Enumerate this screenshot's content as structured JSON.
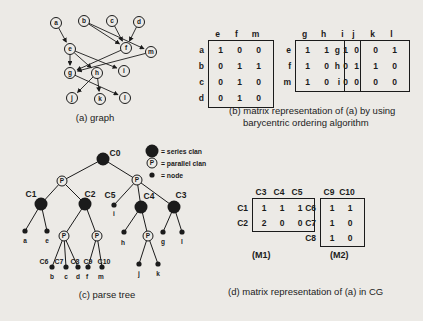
{
  "figure": {
    "background": "#eceae6",
    "ink": "#1b1b1b"
  },
  "graph_panel": {
    "caption": "(a) graph",
    "nodes": [
      {
        "id": "a",
        "x": 56,
        "y": 23
      },
      {
        "id": "b",
        "x": 84,
        "y": 21
      },
      {
        "id": "c",
        "x": 112,
        "y": 21
      },
      {
        "id": "d",
        "x": 139,
        "y": 22
      },
      {
        "id": "e",
        "x": 70,
        "y": 49
      },
      {
        "id": "f",
        "x": 126,
        "y": 48
      },
      {
        "id": "m",
        "x": 151,
        "y": 52
      },
      {
        "id": "g",
        "x": 70,
        "y": 73
      },
      {
        "id": "h",
        "x": 97,
        "y": 73
      },
      {
        "id": "i",
        "x": 124,
        "y": 71
      },
      {
        "id": "j",
        "x": 72,
        "y": 98
      },
      {
        "id": "k",
        "x": 100,
        "y": 99
      },
      {
        "id": "l",
        "x": 125,
        "y": 98
      }
    ],
    "edges": [
      {
        "from": "a",
        "to": "e"
      },
      {
        "from": "b",
        "to": "f"
      },
      {
        "from": "b",
        "to": "m"
      },
      {
        "from": "c",
        "to": "f"
      },
      {
        "from": "d",
        "to": "f"
      },
      {
        "from": "e",
        "to": "g"
      },
      {
        "from": "e",
        "to": "h"
      },
      {
        "from": "e",
        "to": "i"
      },
      {
        "from": "f",
        "to": "g"
      },
      {
        "from": "m",
        "to": "g"
      },
      {
        "from": "g",
        "to": "l"
      },
      {
        "from": "h",
        "to": "j"
      },
      {
        "from": "h",
        "to": "k"
      }
    ]
  },
  "matrix_panel_b": {
    "caption_line1": "(b) matrix representation of (a) by using",
    "caption_line2": "barycentric ordering algorithm",
    "matrices": [
      {
        "col_headers": [
          "e",
          "f",
          "m"
        ],
        "row_labels": [
          "a",
          "b",
          "c",
          "d"
        ],
        "values": [
          [
            1,
            0,
            0
          ],
          [
            0,
            1,
            1
          ],
          [
            0,
            1,
            0
          ],
          [
            0,
            1,
            0
          ]
        ]
      },
      {
        "col_headers": [
          "g",
          "h",
          "i"
        ],
        "row_labels": [
          "e",
          "f",
          "m"
        ],
        "values": [
          [
            1,
            1,
            1
          ],
          [
            1,
            0,
            0
          ],
          [
            1,
            0,
            0
          ]
        ]
      },
      {
        "col_headers": [
          "j",
          "k",
          "l"
        ],
        "row_labels": [
          "g",
          "h",
          "i"
        ],
        "values": [
          [
            0,
            0,
            1
          ],
          [
            1,
            1,
            0
          ],
          [
            0,
            0,
            0
          ]
        ]
      }
    ]
  },
  "tree_panel": {
    "caption": "(c) parse tree",
    "legend": [
      {
        "type": "series",
        "label": "= series clan"
      },
      {
        "type": "parallel",
        "label": "= parallel clan"
      },
      {
        "type": "leaf",
        "label": "= node"
      }
    ],
    "nodes": [
      {
        "id": "C0",
        "type": "series",
        "x": 103,
        "y": 159,
        "label": "C0",
        "lx": 115,
        "ly": 156
      },
      {
        "id": "PL",
        "type": "parallel",
        "x": 62,
        "y": 181
      },
      {
        "id": "PR",
        "type": "parallel",
        "x": 137,
        "y": 180
      },
      {
        "id": "C1",
        "type": "series",
        "x": 41,
        "y": 204,
        "label": "C1",
        "lx": 31,
        "ly": 197
      },
      {
        "id": "C2",
        "type": "series",
        "x": 85,
        "y": 204,
        "label": "C2",
        "lx": 90,
        "ly": 197
      },
      {
        "id": "C5",
        "type": "leaf",
        "x": 114,
        "y": 205,
        "label": "C5",
        "lx": 110,
        "ly": 198,
        "letter": "i",
        "tx": 114,
        "ty": 216
      },
      {
        "id": "C4",
        "type": "series",
        "x": 141,
        "y": 207,
        "label": "C4",
        "lx": 149,
        "ly": 199
      },
      {
        "id": "C3",
        "type": "series",
        "x": 174,
        "y": 207,
        "label": "C3",
        "lx": 181,
        "ly": 198
      },
      {
        "id": "na",
        "type": "leaf",
        "x": 25,
        "y": 231,
        "letter": "a",
        "tx": 25,
        "ty": 243
      },
      {
        "id": "ne",
        "type": "leaf",
        "x": 47,
        "y": 231,
        "letter": "e",
        "tx": 47,
        "ty": 243
      },
      {
        "id": "P1",
        "type": "parallel",
        "x": 64,
        "y": 236
      },
      {
        "id": "P2",
        "type": "parallel",
        "x": 97,
        "y": 236
      },
      {
        "id": "nb",
        "type": "leaf",
        "x": 52,
        "y": 267,
        "label": "C6",
        "lx": 44,
        "ly": 264,
        "letter": "b",
        "tx": 52,
        "ty": 279
      },
      {
        "id": "nc",
        "type": "leaf",
        "x": 66,
        "y": 267,
        "label": "C7",
        "lx": 59,
        "ly": 264,
        "letter": "c",
        "tx": 66,
        "ty": 279
      },
      {
        "id": "nd",
        "type": "leaf",
        "x": 78,
        "y": 267,
        "label": "C8",
        "lx": 75,
        "ly": 264,
        "letter": "d",
        "tx": 78,
        "ty": 279
      },
      {
        "id": "nf",
        "type": "leaf",
        "x": 88,
        "y": 267,
        "label": "C9",
        "lx": 88,
        "ly": 264,
        "letter": "f",
        "tx": 87,
        "ty": 279
      },
      {
        "id": "nm",
        "type": "leaf",
        "x": 102,
        "y": 267,
        "label": "C10",
        "lx": 104,
        "ly": 264,
        "letter": "m",
        "tx": 101,
        "ty": 279
      },
      {
        "id": "nh",
        "type": "leaf",
        "x": 124,
        "y": 232,
        "letter": "h",
        "tx": 123,
        "ty": 245
      },
      {
        "id": "P3",
        "type": "parallel",
        "x": 148,
        "y": 236
      },
      {
        "id": "nj",
        "type": "leaf",
        "x": 139,
        "y": 264,
        "letter": "j",
        "tx": 139,
        "ty": 276
      },
      {
        "id": "nk",
        "type": "leaf",
        "x": 158,
        "y": 264,
        "letter": "k",
        "tx": 158,
        "ty": 276
      },
      {
        "id": "ng",
        "type": "leaf",
        "x": 163,
        "y": 232,
        "letter": "g",
        "tx": 163,
        "ty": 244
      },
      {
        "id": "nl",
        "type": "leaf",
        "x": 182,
        "y": 232,
        "letter": "l",
        "tx": 182,
        "ty": 244
      }
    ],
    "edges": [
      [
        "C0",
        "PL"
      ],
      [
        "C0",
        "PR"
      ],
      [
        "PL",
        "C1"
      ],
      [
        "PL",
        "C2"
      ],
      [
        "PR",
        "C5"
      ],
      [
        "PR",
        "C4"
      ],
      [
        "PR",
        "C3"
      ],
      [
        "C1",
        "na"
      ],
      [
        "C1",
        "ne"
      ],
      [
        "C2",
        "P1"
      ],
      [
        "C2",
        "P2"
      ],
      [
        "P1",
        "nb"
      ],
      [
        "P1",
        "nc"
      ],
      [
        "P1",
        "nd"
      ],
      [
        "P2",
        "nf"
      ],
      [
        "P2",
        "nm"
      ],
      [
        "C4",
        "nh"
      ],
      [
        "C4",
        "P3"
      ],
      [
        "P3",
        "nj"
      ],
      [
        "P3",
        "nk"
      ],
      [
        "C3",
        "ng"
      ],
      [
        "C3",
        "nl"
      ]
    ]
  },
  "matrix_panel_d": {
    "caption": "(d) matrix representation of (a) in CG",
    "matrices": [
      {
        "name": "(M1)",
        "col_headers": [
          "C3",
          "C4",
          "C5"
        ],
        "row_labels": [
          "C1",
          "C2"
        ],
        "values": [
          [
            1,
            1,
            1
          ],
          [
            2,
            0,
            0
          ]
        ]
      },
      {
        "name": "(M2)",
        "col_headers": [
          "C9",
          "C10"
        ],
        "row_labels": [
          "C6",
          "C7",
          "C8"
        ],
        "values": [
          [
            1,
            1
          ],
          [
            1,
            0
          ],
          [
            1,
            0
          ]
        ]
      }
    ]
  }
}
